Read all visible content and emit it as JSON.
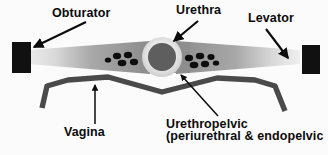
{
  "figure": {
    "type": "anatomical-diagram",
    "background_color": "#fbfbfb"
  },
  "labels": {
    "obturator": "Obturator",
    "urethra": "Urethra",
    "levator": "Levator",
    "vagina": "Vagina",
    "urethropelvic_line1": "Urethropelvic",
    "urethropelvic_line2": "(periurethral & endopelvic"
  },
  "colors": {
    "obturator_block": "#111111",
    "levator_sheet": "#8a8a8a",
    "levator_tip": "#dcdcdc",
    "urethra_ring": "#e4e4e4",
    "urethra_lumen": "#5e5e5e",
    "glands": "#0d0d0d",
    "vagina_line": "#4a4a4a",
    "arrow": "#0b0b0b",
    "text": "#0b0b0b"
  },
  "structures": {
    "obturator_left": {
      "x": 12,
      "y": 42,
      "width": 19,
      "height": 31
    },
    "obturator_right": {
      "x": 302,
      "y": 45,
      "width": 18,
      "height": 29
    },
    "urethra": {
      "cx": 162,
      "cy": 57,
      "ring_radius": 20,
      "lumen_radius": 14
    },
    "gland_cluster_left_count": 5,
    "gland_cluster_right_count": 6
  },
  "arrows": {
    "obturator": {
      "from": [
        86,
        22
      ],
      "to": [
        32,
        47
      ]
    },
    "urethra": {
      "from": [
        196,
        22
      ],
      "to": [
        173,
        42
      ]
    },
    "levator": {
      "from": [
        268,
        28
      ],
      "to": [
        288,
        58
      ]
    },
    "vagina": {
      "from": [
        95,
        124
      ],
      "to": [
        95,
        86
      ]
    },
    "urethropelvic": {
      "from": [
        217,
        116
      ],
      "to": [
        181,
        76
      ]
    }
  }
}
